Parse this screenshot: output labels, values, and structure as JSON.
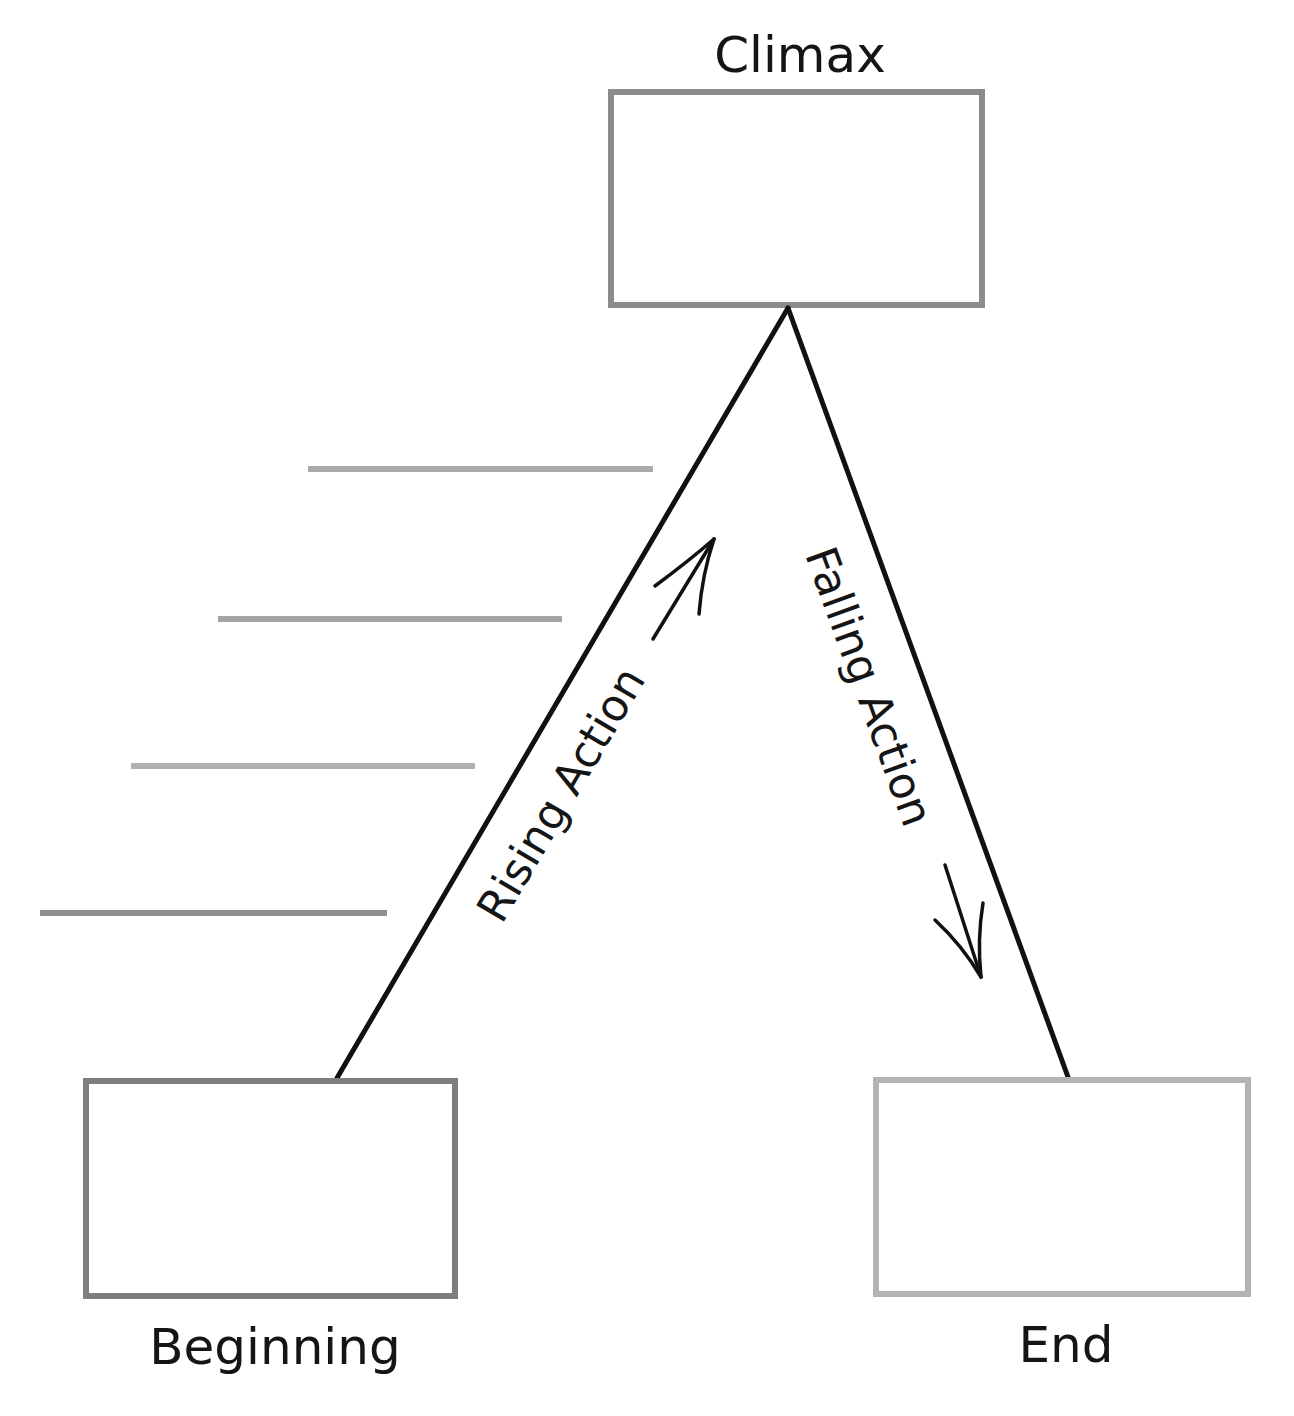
{
  "diagram": {
    "title_cut_off": "",
    "type": "plot-diagram",
    "nodes": {
      "climax": {
        "label": "Climax",
        "box": {
          "x": 608,
          "y": 89,
          "w": 377,
          "h": 219
        },
        "border": "#8c8c8c"
      },
      "beginning": {
        "label": "Beginning",
        "box": {
          "x": 83,
          "y": 1078,
          "w": 375,
          "h": 221
        },
        "border": "#7e7e7e"
      },
      "end": {
        "label": "End",
        "box": {
          "x": 873,
          "y": 1077,
          "w": 378,
          "h": 220
        },
        "border": "#b3b3b3"
      }
    },
    "edges": {
      "rising": {
        "label": "Rising Action",
        "from": [
          337,
          1078
        ],
        "to": [
          788,
          308
        ],
        "arrow": "up-right"
      },
      "falling": {
        "label": "Falling Action",
        "from": [
          788,
          308
        ],
        "to": [
          1068,
          1077
        ],
        "arrow": "down"
      }
    },
    "answer_lines": [
      {
        "x1": 308,
        "x2": 653,
        "y": 469,
        "color": "#aaaaaa"
      },
      {
        "x1": 218,
        "x2": 562,
        "y": 619,
        "color": "#a4a4a4"
      },
      {
        "x1": 131,
        "x2": 475,
        "y": 766,
        "color": "#b0b0b0"
      },
      {
        "x1": 40,
        "x2": 387,
        "y": 913,
        "color": "#8f8f8f"
      }
    ],
    "colors": {
      "stroke": "#111111",
      "text": "#151515",
      "background": "#ffffff"
    }
  }
}
